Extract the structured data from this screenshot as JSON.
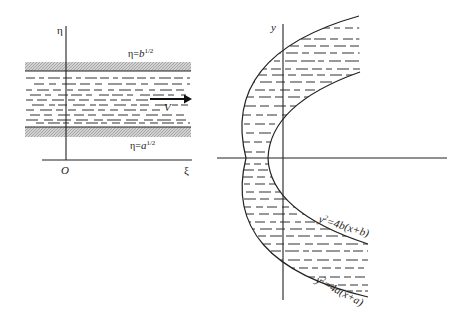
{
  "left_panel": {
    "axes": {
      "vertical_label": "η",
      "horizontal_label": "ξ",
      "origin_label": "O"
    },
    "upper_wall": {
      "label_base": "η=",
      "label_var": "b",
      "label_exp": "1/2"
    },
    "lower_wall": {
      "label_base": "η=",
      "label_var": "a",
      "label_exp": "1/2"
    },
    "flow": {
      "velocity_label": "V"
    }
  },
  "right_panel": {
    "axes": {
      "vertical_label": "y"
    },
    "inner_curve": {
      "label_y": "y",
      "label_exp": "2",
      "label_rhs": "=4b(x+b)"
    },
    "outer_curve": {
      "label_y": "y",
      "label_exp": "2",
      "label_rhs": "=4a(x+a)"
    }
  },
  "colors": {
    "ink": "#222222",
    "hatch": "#b8b8b8",
    "background": "#ffffff"
  }
}
